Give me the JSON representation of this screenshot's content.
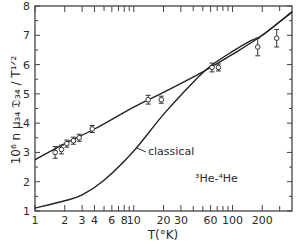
{
  "chart_data": {
    "type": "scatter",
    "title": "",
    "xlabel": "T(°K)",
    "ylabel": "10⁶ n μ₃₄ 𝔇₃₄ / T¹ᐟ²",
    "xscale": "log",
    "xlim": [
      1,
      400
    ],
    "ylim": [
      1,
      8
    ],
    "x_ticks_labeled": [
      1,
      2,
      3,
      4,
      6,
      8,
      10,
      20,
      30,
      60,
      100,
      200
    ],
    "x_tick_labels": [
      "1",
      "2",
      "3",
      "4",
      "6",
      "8",
      "10",
      "20",
      "30",
      "60",
      "100",
      "200"
    ],
    "x_ticks_minor": [
      5,
      7,
      9,
      40,
      50,
      70,
      80,
      90,
      300
    ],
    "y_ticks": [
      1,
      2,
      3,
      4,
      5,
      6,
      7,
      8
    ],
    "y_tick_labels": [
      "1",
      "2",
      "3",
      "4",
      "5",
      "6",
      "7",
      "8"
    ],
    "grid": false,
    "series": [
      {
        "name": "experimental",
        "kind": "points-with-errorbars",
        "x": [
          1.6,
          1.85,
          2.1,
          2.45,
          2.8,
          3.8,
          14,
          19,
          62,
          72,
          180,
          280
        ],
        "y": [
          3.0,
          3.1,
          3.3,
          3.4,
          3.5,
          3.8,
          4.8,
          4.8,
          5.9,
          5.9,
          6.6,
          6.9
        ],
        "yerr": [
          0.2,
          0.15,
          0.12,
          0.12,
          0.12,
          0.12,
          0.15,
          0.12,
          0.15,
          0.12,
          0.3,
          0.3
        ]
      },
      {
        "name": "quantum",
        "kind": "line",
        "x": [
          1,
          2,
          4,
          10,
          20,
          50,
          100,
          200,
          400
        ],
        "y": [
          2.75,
          3.3,
          3.8,
          4.55,
          5.05,
          5.75,
          6.35,
          7.0,
          7.8
        ]
      },
      {
        "name": "classical",
        "kind": "line",
        "x": [
          1,
          2,
          3,
          5,
          10,
          20,
          40,
          60,
          100,
          150,
          200,
          400
        ],
        "y": [
          1.1,
          1.35,
          1.55,
          2.05,
          3.05,
          4.3,
          5.4,
          5.95,
          6.45,
          6.8,
          7.0,
          7.8
        ]
      }
    ],
    "annotations": [
      {
        "text": "classical",
        "target_series": "classical"
      },
      {
        "text": "³He-⁴He"
      }
    ]
  }
}
